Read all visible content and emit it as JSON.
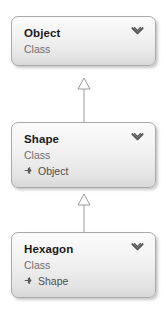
{
  "diagram": {
    "type": "uml-class-hierarchy",
    "background_color": "#ffffff",
    "node_fill_top": "#fbfbfb",
    "node_fill_bottom": "#d8d8d8",
    "node_border_color": "#a9a9a9",
    "title_color": "#1a1a1a",
    "stereotype_color": "#6e6e6e",
    "base_label_color": "#4f4f4f",
    "connector_color": "#9a9a9a",
    "collapse_icon": "chevron-down-icon",
    "base_icon": "inheritance-arrow-icon"
  },
  "nodes": [
    {
      "title": "Object",
      "stereotype": "Class",
      "base": "",
      "collapse_label": "Collapse"
    },
    {
      "title": "Shape",
      "stereotype": "Class",
      "base": "Object",
      "collapse_label": "Collapse"
    },
    {
      "title": "Hexagon",
      "stereotype": "Class",
      "base": "Shape",
      "collapse_label": "Collapse"
    }
  ],
  "relations": [
    {
      "kind": "generalization",
      "from": "Shape",
      "to": "Object"
    },
    {
      "kind": "generalization",
      "from": "Hexagon",
      "to": "Shape"
    }
  ]
}
